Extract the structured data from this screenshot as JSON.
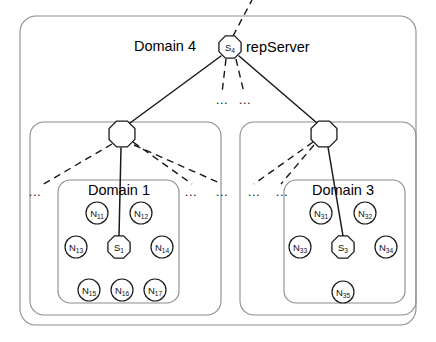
{
  "figure": {
    "background_color": "#ffffff",
    "line_color": "#1a1a1a",
    "box_color": "#8c8c8c"
  },
  "containers": [
    {
      "id": "domain4-outer",
      "label": "Domain 4",
      "label_x": 165,
      "label_y": 46,
      "x": 20,
      "y": 16,
      "w": 396,
      "h": 309,
      "r": 16
    },
    {
      "id": "domain1-group",
      "label": "",
      "x": 30,
      "y": 122,
      "w": 191,
      "h": 193,
      "r": 14
    },
    {
      "id": "domain3-group",
      "label": "",
      "x": 240,
      "y": 122,
      "w": 176,
      "h": 193,
      "r": 14
    },
    {
      "id": "domain1-inner",
      "label": "Domain 1",
      "label_x": 119,
      "label_y": 190,
      "x": 58,
      "y": 180,
      "w": 121,
      "h": 123,
      "r": 12
    },
    {
      "id": "domain3-inner",
      "label": "Domain 3",
      "label_x": 343,
      "label_y": 190,
      "x": 284,
      "y": 180,
      "w": 121,
      "h": 123,
      "r": 12
    }
  ],
  "nodes": [
    {
      "id": "S4",
      "base": "S",
      "sub": "4",
      "shape": "octagon",
      "cx": 230,
      "cy": 47,
      "r": 12
    },
    {
      "id": "R1",
      "base": "",
      "sub": "",
      "shape": "octagon",
      "cx": 122,
      "cy": 134,
      "r": 14
    },
    {
      "id": "R3",
      "base": "",
      "sub": "",
      "shape": "octagon",
      "cx": 324,
      "cy": 134,
      "r": 14
    },
    {
      "id": "S1",
      "base": "S",
      "sub": "1",
      "shape": "octagon",
      "cx": 119,
      "cy": 247,
      "r": 12
    },
    {
      "id": "S3",
      "base": "S",
      "sub": "3",
      "shape": "octagon",
      "cx": 343,
      "cy": 247,
      "r": 12
    },
    {
      "id": "N11",
      "base": "N",
      "sub": "11",
      "shape": "circle",
      "cx": 97,
      "cy": 213,
      "r": 11
    },
    {
      "id": "N12",
      "base": "N",
      "sub": "12",
      "shape": "circle",
      "cx": 141,
      "cy": 213,
      "r": 11
    },
    {
      "id": "N13",
      "base": "N",
      "sub": "13",
      "shape": "circle",
      "cx": 76,
      "cy": 247,
      "r": 11
    },
    {
      "id": "N14",
      "base": "N",
      "sub": "14",
      "shape": "circle",
      "cx": 162,
      "cy": 247,
      "r": 11
    },
    {
      "id": "N15",
      "base": "N",
      "sub": "15",
      "shape": "circle",
      "cx": 89,
      "cy": 290,
      "r": 11
    },
    {
      "id": "N16",
      "base": "N",
      "sub": "16",
      "shape": "circle",
      "cx": 122,
      "cy": 290,
      "r": 11
    },
    {
      "id": "N17",
      "base": "N",
      "sub": "17",
      "shape": "circle",
      "cx": 155,
      "cy": 290,
      "r": 11
    },
    {
      "id": "N31",
      "base": "N",
      "sub": "31",
      "shape": "circle",
      "cx": 321,
      "cy": 213,
      "r": 11
    },
    {
      "id": "N32",
      "base": "N",
      "sub": "32",
      "shape": "circle",
      "cx": 365,
      "cy": 213,
      "r": 11
    },
    {
      "id": "N33",
      "base": "N",
      "sub": "33",
      "shape": "circle",
      "cx": 300,
      "cy": 247,
      "r": 11
    },
    {
      "id": "N34",
      "base": "N",
      "sub": "34",
      "shape": "circle",
      "cx": 386,
      "cy": 247,
      "r": 11
    },
    {
      "id": "N35",
      "base": "N",
      "sub": "35",
      "shape": "circle",
      "cx": 343,
      "cy": 292,
      "r": 11
    }
  ],
  "annotations": [
    {
      "id": "repserver-label",
      "text": "repServer",
      "x": 246,
      "y": 47,
      "anchor": "start"
    }
  ],
  "ellipses": [
    {
      "id": "ell-left-outer",
      "text": "...",
      "x": 35,
      "y": 191
    },
    {
      "id": "ell-d1-right-a",
      "text": "...",
      "x": 191,
      "y": 191
    },
    {
      "id": "ell-d1-right-b",
      "text": "...",
      "x": 222,
      "y": 191
    },
    {
      "id": "ell-d3-left-a",
      "text": "...",
      "x": 254,
      "y": 191
    },
    {
      "id": "ell-d3-left-b",
      "text": "...",
      "x": 282,
      "y": 191
    },
    {
      "id": "ell-s4-a",
      "text": "...",
      "x": 222,
      "y": 99
    },
    {
      "id": "ell-s4-b",
      "text": "...",
      "x": 245,
      "y": 99
    }
  ],
  "edges": [
    {
      "id": "e-s4-up",
      "style": "dashed",
      "x1": 233,
      "y1": 36,
      "x2": 252,
      "y2": 0
    },
    {
      "id": "e-s4-r1",
      "style": "solid",
      "x1": 221,
      "y1": 56,
      "x2": 130,
      "y2": 123
    },
    {
      "id": "e-s4-r3",
      "style": "solid",
      "x1": 239,
      "y1": 56,
      "x2": 317,
      "y2": 123
    },
    {
      "id": "e-s4-d1",
      "style": "dashed",
      "x1": 226,
      "y1": 59,
      "x2": 222,
      "y2": 93
    },
    {
      "id": "e-s4-d2",
      "style": "dashed",
      "x1": 236,
      "y1": 59,
      "x2": 244,
      "y2": 93
    },
    {
      "id": "e-r1-s1",
      "style": "solid",
      "x1": 121,
      "y1": 148,
      "x2": 119,
      "y2": 236
    },
    {
      "id": "e-r1-l1",
      "style": "dashed",
      "x1": 112,
      "y1": 144,
      "x2": 42,
      "y2": 185
    },
    {
      "id": "e-r1-r1",
      "style": "dashed",
      "x1": 133,
      "y1": 142,
      "x2": 192,
      "y2": 184
    },
    {
      "id": "e-r1-r2",
      "style": "dashed",
      "x1": 134,
      "y1": 145,
      "x2": 222,
      "y2": 184
    },
    {
      "id": "e-r3-s3",
      "style": "solid",
      "x1": 328,
      "y1": 147,
      "x2": 343,
      "y2": 236
    },
    {
      "id": "e-r3-l1",
      "style": "dashed",
      "x1": 313,
      "y1": 142,
      "x2": 254,
      "y2": 184
    },
    {
      "id": "e-r3-l2",
      "style": "dashed",
      "x1": 314,
      "y1": 145,
      "x2": 281,
      "y2": 184
    }
  ]
}
